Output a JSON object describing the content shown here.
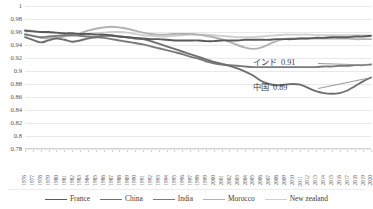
{
  "chart_data": {
    "type": "line",
    "title": "",
    "xlabel": "",
    "ylabel": "",
    "ylim": [
      0.78,
      1.0
    ],
    "ytick_step": 0.02,
    "grid": true,
    "legend_position": "bottom",
    "ytick_labels": [
      "1",
      "0.98",
      "0.96",
      "0.94",
      "0.92",
      "0.9",
      "0.88",
      "0.86",
      "0.84",
      "0.82",
      "0.8",
      "0.78"
    ],
    "ytick_values": [
      1,
      0.98,
      0.96,
      0.94,
      0.92,
      0.9,
      0.88,
      0.86,
      0.84,
      0.82,
      0.8,
      0.78
    ],
    "x": [
      1976,
      1977,
      1978,
      1979,
      1980,
      1981,
      1982,
      1983,
      1984,
      1985,
      1986,
      1987,
      1988,
      1989,
      1990,
      1991,
      1992,
      1993,
      1994,
      1995,
      1996,
      1997,
      1998,
      1999,
      2000,
      2001,
      2002,
      2003,
      2004,
      2005,
      2006,
      2007,
      2008,
      2009,
      2010,
      2011,
      2012,
      2013,
      2014,
      2015,
      2016,
      2017,
      2018,
      2019,
      2020
    ],
    "xtick_labels": [
      "1976",
      "1977",
      "1978",
      "1979",
      "1980",
      "1981",
      "1982",
      "1983",
      "1984",
      "1985",
      "1986",
      "1987",
      "1988",
      "1989",
      "1990",
      "1991",
      "1992",
      "1993",
      "1994",
      "1995",
      "1996",
      "1997",
      "1998",
      "1999",
      "2000",
      "2001",
      "2002",
      "2003",
      "2004",
      "2005",
      "2006",
      "2007",
      "2008",
      "2009",
      "2010",
      "2011",
      "2012",
      "2013",
      "2014",
      "2015",
      "2016",
      "2017",
      "2018",
      "2019",
      "2020"
    ],
    "series": [
      {
        "name": "France",
        "color": "#5a5a5a",
        "width": 1.9,
        "values": [
          0.962,
          0.961,
          0.96,
          0.96,
          0.959,
          0.958,
          0.958,
          0.957,
          0.957,
          0.956,
          0.956,
          0.955,
          0.953,
          0.952,
          0.951,
          0.95,
          0.949,
          0.949,
          0.948,
          0.947,
          0.947,
          0.947,
          0.947,
          0.946,
          0.946,
          0.947,
          0.947,
          0.947,
          0.948,
          0.948,
          0.948,
          0.948,
          0.949,
          0.949,
          0.949,
          0.95,
          0.95,
          0.951,
          0.951,
          0.952,
          0.952,
          0.952,
          0.953,
          0.953,
          0.954
        ]
      },
      {
        "name": "China",
        "color": "#6f6f6f",
        "width": 1.9,
        "values": [
          0.952,
          0.948,
          0.944,
          0.947,
          0.95,
          0.948,
          0.945,
          0.947,
          0.95,
          0.952,
          0.954,
          0.954,
          0.953,
          0.952,
          0.95,
          0.949,
          0.946,
          0.942,
          0.938,
          0.934,
          0.93,
          0.926,
          0.922,
          0.918,
          0.914,
          0.911,
          0.908,
          0.904,
          0.899,
          0.893,
          0.885,
          0.88,
          0.878,
          0.879,
          0.88,
          0.879,
          0.874,
          0.869,
          0.866,
          0.865,
          0.866,
          0.87,
          0.877,
          0.884,
          0.89
        ]
      },
      {
        "name": "India",
        "color": "#7a7a7a",
        "width": 1.9,
        "values": [
          0.956,
          0.954,
          0.952,
          0.953,
          0.954,
          0.955,
          0.955,
          0.954,
          0.953,
          0.952,
          0.951,
          0.949,
          0.947,
          0.945,
          0.943,
          0.941,
          0.938,
          0.935,
          0.932,
          0.929,
          0.926,
          0.922,
          0.919,
          0.915,
          0.912,
          0.91,
          0.909,
          0.908,
          0.907,
          0.906,
          0.906,
          0.906,
          0.906,
          0.906,
          0.906,
          0.906,
          0.906,
          0.906,
          0.907,
          0.907,
          0.908,
          0.908,
          0.909,
          0.909,
          0.91
        ]
      },
      {
        "name": "Morocco",
        "color": "#b2b2b2",
        "width": 1.9,
        "values": [
          0.957,
          0.954,
          0.951,
          0.95,
          0.951,
          0.953,
          0.955,
          0.958,
          0.962,
          0.965,
          0.967,
          0.968,
          0.967,
          0.965,
          0.962,
          0.959,
          0.957,
          0.956,
          0.956,
          0.957,
          0.957,
          0.957,
          0.956,
          0.954,
          0.952,
          0.949,
          0.945,
          0.94,
          0.936,
          0.934,
          0.936,
          0.941,
          0.946,
          0.949,
          0.95,
          0.95,
          0.95,
          0.95,
          0.95,
          0.95,
          0.95,
          0.95,
          0.949,
          0.949,
          0.949
        ]
      },
      {
        "name": "New zealand",
        "color": "#cfcfcf",
        "width": 1.9,
        "values": [
          0.963,
          0.962,
          0.96,
          0.959,
          0.958,
          0.957,
          0.956,
          0.956,
          0.957,
          0.958,
          0.959,
          0.96,
          0.96,
          0.959,
          0.957,
          0.955,
          0.954,
          0.953,
          0.953,
          0.954,
          0.955,
          0.956,
          0.956,
          0.956,
          0.955,
          0.954,
          0.953,
          0.952,
          0.952,
          0.952,
          0.953,
          0.954,
          0.955,
          0.956,
          0.956,
          0.956,
          0.956,
          0.955,
          0.955,
          0.955,
          0.955,
          0.955,
          0.955,
          0.955,
          0.955
        ]
      }
    ],
    "annotations": [
      {
        "label": "インド",
        "value": "0.91",
        "series": "India"
      },
      {
        "label": "中国",
        "value": "0.89",
        "series": "China"
      }
    ]
  },
  "legend": {
    "items": [
      {
        "label": "France"
      },
      {
        "label": "China"
      },
      {
        "label": "India"
      },
      {
        "label": "Morocco"
      },
      {
        "label": "New zealand"
      }
    ]
  }
}
